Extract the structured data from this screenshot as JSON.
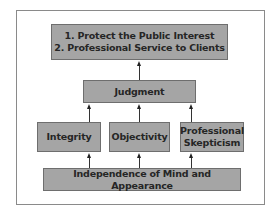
{
  "diagram": {
    "goals": {
      "line1": "1. Protect the Public Interest",
      "line2": "2. Professional Service to Clients"
    },
    "judgment": "Judgment",
    "principles": [
      {
        "line1": "Integrity",
        "line2": ""
      },
      {
        "line1": "Objectivity",
        "line2": ""
      },
      {
        "line1": "Professional",
        "line2": "Skepticism"
      }
    ],
    "foundation": "Independence of Mind and Appearance",
    "colors": {
      "box_fill": "#a5a5a5",
      "text": "#262626",
      "frame": "#8a8a8a"
    }
  }
}
